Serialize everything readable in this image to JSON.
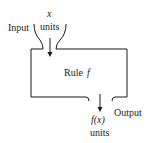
{
  "diagram": {
    "type": "function-machine",
    "input": {
      "label": "Input",
      "variable": "x",
      "units": "units"
    },
    "machine": {
      "label": "Rule",
      "rule_name": "f"
    },
    "output": {
      "label": "Output",
      "expression": "f(x)",
      "units": "units"
    },
    "colors": {
      "line": "#1a1a1a",
      "background": "#ffffff"
    }
  }
}
